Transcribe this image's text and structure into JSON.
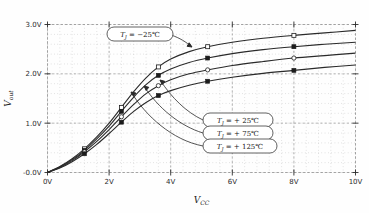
{
  "chart_data": {
    "type": "line",
    "title": "",
    "xlabel": "V_CC",
    "ylabel": "V_out",
    "xlabel_main": "V",
    "xlabel_sub": "CC",
    "ylabel_main": "V",
    "ylabel_sub": "out",
    "xlim": [
      0,
      10
    ],
    "ylim": [
      -0.0,
      3.0
    ],
    "grid": true,
    "legend_position": "inline-callouts",
    "xticks": [
      0,
      2,
      4,
      6,
      8,
      10
    ],
    "xtick_labels": [
      "0V",
      "2V",
      "4V",
      "6V",
      "8V",
      "10V"
    ],
    "yticks": [
      0.0,
      1.0,
      2.0,
      3.0
    ],
    "ytick_labels": [
      "-0.0V",
      "1.0V",
      "2.0V",
      "3.0V"
    ],
    "x_minor_step": 0.4,
    "y_minor_step": 0.2,
    "marker_styles": [
      "open-square",
      "filled-square",
      "open-circle",
      "filled-square"
    ],
    "series": [
      {
        "name": "Tj = -25°C",
        "label": "T",
        "label_sub": "J",
        "label_value": "= −25℃",
        "marker": "open-square",
        "x": [
          0,
          0.4,
          0.8,
          1.2,
          1.6,
          2.0,
          2.4,
          2.8,
          3.2,
          3.6,
          4.0,
          4.6,
          5.2,
          6.0,
          7.0,
          8.0,
          9.0,
          10.0
        ],
        "y": [
          0.0,
          0.12,
          0.28,
          0.48,
          0.72,
          1.0,
          1.32,
          1.64,
          1.92,
          2.14,
          2.3,
          2.45,
          2.55,
          2.64,
          2.72,
          2.78,
          2.83,
          2.88
        ]
      },
      {
        "name": "Tj = +25°C",
        "label": "T",
        "label_sub": "J",
        "label_value": "= + 25℃",
        "marker": "filled-square",
        "x": [
          0,
          0.4,
          0.8,
          1.2,
          1.6,
          2.0,
          2.4,
          2.8,
          3.2,
          3.6,
          4.0,
          4.6,
          5.2,
          6.0,
          7.0,
          8.0,
          9.0,
          10.0
        ],
        "y": [
          0.0,
          0.11,
          0.26,
          0.45,
          0.68,
          0.94,
          1.24,
          1.53,
          1.78,
          1.97,
          2.1,
          2.23,
          2.32,
          2.41,
          2.49,
          2.55,
          2.6,
          2.64
        ]
      },
      {
        "name": "Tj = +75°C",
        "label": "T",
        "label_sub": "J",
        "label_value": "= + 75℃",
        "marker": "open-circle",
        "x": [
          0,
          0.4,
          0.8,
          1.2,
          1.6,
          2.0,
          2.4,
          2.8,
          3.2,
          3.6,
          4.0,
          4.6,
          5.2,
          6.0,
          7.0,
          8.0,
          9.0,
          10.0
        ],
        "y": [
          0.0,
          0.1,
          0.24,
          0.42,
          0.63,
          0.87,
          1.13,
          1.38,
          1.6,
          1.76,
          1.88,
          2.0,
          2.08,
          2.17,
          2.25,
          2.32,
          2.37,
          2.42
        ]
      },
      {
        "name": "Tj = +125°C",
        "label": "T",
        "label_sub": "J",
        "label_value": "= + 125℃",
        "marker": "filled-square",
        "x": [
          0,
          0.4,
          0.8,
          1.2,
          1.6,
          2.0,
          2.4,
          2.8,
          3.2,
          3.6,
          4.0,
          4.6,
          5.2,
          6.0,
          7.0,
          8.0,
          9.0,
          10.0
        ],
        "y": [
          0.0,
          0.09,
          0.22,
          0.38,
          0.57,
          0.79,
          1.02,
          1.24,
          1.42,
          1.56,
          1.66,
          1.77,
          1.85,
          1.93,
          2.01,
          2.07,
          2.13,
          2.18
        ]
      }
    ],
    "annotations": [
      {
        "text": "T_J = -25℃",
        "x": 3.2,
        "y": 2.78
      },
      {
        "text": "T_J = + 25℃",
        "x": 5.1,
        "y": 1.28
      },
      {
        "text": "T_J = + 75℃",
        "x": 5.1,
        "y": 0.93
      },
      {
        "text": "T_J = + 125℃",
        "x": 5.1,
        "y": 0.58
      }
    ],
    "colors": {
      "curve": "#2a2a2a",
      "grid_major": "#9a9a9a",
      "grid_minor": "#bdbdbd",
      "text": "#1a1a1a",
      "background": "#fefefe"
    }
  }
}
